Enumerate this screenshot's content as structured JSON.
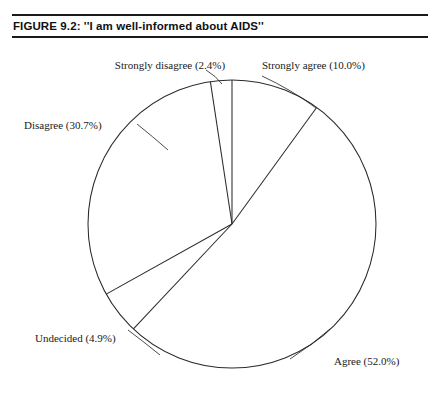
{
  "figure": {
    "title": "FIGURE 9.2:  ''I am well-informed about AIDS''"
  },
  "chart_data": {
    "type": "pie",
    "title": "''I am well-informed about AIDS''",
    "categories": [
      "Strongly agree",
      "Agree",
      "Undecided",
      "Disagree",
      "Strongly disagree"
    ],
    "values": [
      10.0,
      52.0,
      4.9,
      30.7,
      2.4
    ],
    "unit": "percent",
    "start_angle_deg": 0,
    "direction": "clockwise",
    "legend": "none",
    "grid": false,
    "labels": [
      {
        "name": "Strongly agree",
        "value": 10.0,
        "text": "Strongly agree (10.0%)"
      },
      {
        "name": "Agree",
        "value": 52.0,
        "text": "Agree (52.0%)"
      },
      {
        "name": "Undecided",
        "value": 4.9,
        "text": "Undecided (4.9%)"
      },
      {
        "name": "Disagree",
        "value": 30.7,
        "text": "Disagree (30.7%)"
      },
      {
        "name": "Strongly disagree",
        "value": 2.4,
        "text": "Strongly disagree (2.4%)"
      }
    ],
    "colors": {
      "slice_fill": "#ffffff",
      "outline": "#2b2b2b",
      "text": "#1a1a1a"
    }
  },
  "labels": {
    "strongly_disagree": "Strongly disagree (2.4%)",
    "strongly_agree": "Strongly agree (10.0%)",
    "disagree": "Disagree (30.7%)",
    "undecided": "Undecided (4.9%)",
    "agree": "Agree (52.0%)"
  }
}
